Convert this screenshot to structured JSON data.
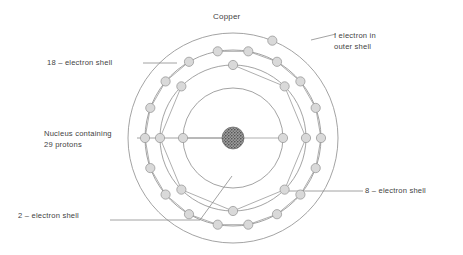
{
  "diagram": {
    "title": "Copper",
    "element": "Copper",
    "nucleus_label_line1": "Nucleus containing",
    "nucleus_label_line2": "29 protons",
    "labels": {
      "outer": {
        "line1": "I electron in",
        "line2": "outer shell"
      },
      "shell18": "18 – electron shell",
      "shell8": "8 – electron shell",
      "shell2": "2 – electron shell"
    }
  },
  "colors": {
    "line": "#8c8c8c",
    "electron_fill": "#d9d9d9",
    "electron_stroke": "#9a9a9a",
    "nucleus": "#555555",
    "text": "#3f3f3f",
    "background": "#ffffff"
  },
  "chart_data": {
    "type": "scatter",
    "title": "Copper",
    "xlabel": "",
    "ylabel": "",
    "center": {
      "x": 233,
      "y": 138
    },
    "nucleus": {
      "radius": 11,
      "protons": 29,
      "texture": "stipple"
    },
    "shells": [
      {
        "name": "2 – electron shell",
        "radius": 50,
        "electron_count": 2,
        "angles_deg": [
          180,
          0
        ]
      },
      {
        "name": "8 – electron shell",
        "radius": 73,
        "electron_count": 8,
        "angles_deg": [
          90,
          45,
          0,
          -45,
          -90,
          -135,
          180,
          135
        ]
      },
      {
        "name": "18 – electron shell",
        "radius": 88,
        "electron_count": 18,
        "angles_deg": [
          100,
          80,
          60,
          40,
          20,
          0,
          -20,
          -40,
          -60,
          -80,
          -100,
          -120,
          -140,
          -160,
          180,
          160,
          140,
          120
        ]
      },
      {
        "name": "outer shell",
        "radius": 105,
        "electron_count": 1,
        "angles_deg": [
          68
        ]
      }
    ],
    "electron_radius": 4.6,
    "legend": [
      "I electron in outer shell",
      "18 – electron shell",
      "8 – electron shell",
      "2 – electron shell",
      "Nucleus containing 29 protons"
    ]
  }
}
